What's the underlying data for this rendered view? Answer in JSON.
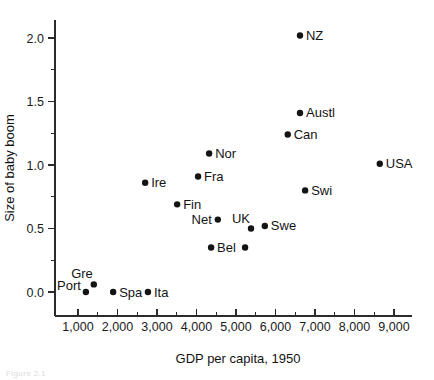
{
  "figure": {
    "caption_faint": "Figure 2.1"
  },
  "chart_data": {
    "type": "scatter",
    "title": "",
    "xlabel": "GDP per capita, 1950",
    "ylabel": "Size of baby boom",
    "xlim": [
      600,
      9600
    ],
    "ylim": [
      -0.28,
      2.22
    ],
    "grid": false,
    "legend": "none",
    "x_ticks": [
      1000,
      2000,
      3000,
      4000,
      5000,
      6000,
      7000,
      8000,
      9000
    ],
    "x_tick_labels": [
      "1,000",
      "2,000",
      "3,000",
      "4,000",
      "5,000",
      "6,000",
      "7,000",
      "8,000",
      "9,000"
    ],
    "x_minor_ticks": [
      1500,
      2500,
      3500,
      4500,
      5500,
      6500,
      7500,
      8500
    ],
    "y_ticks": [
      0.0,
      0.5,
      1.0,
      1.5,
      2.0
    ],
    "y_tick_labels": [
      "0.0",
      "0.5",
      "1.0",
      "1.5",
      "2.0"
    ],
    "y_minor_ticks": [
      0.25,
      0.75,
      1.25,
      1.75
    ],
    "points": [
      {
        "label": "NZ",
        "x": 6620,
        "y": 2.02,
        "label_pos": "right"
      },
      {
        "label": "Austl",
        "x": 6620,
        "y": 1.41,
        "label_pos": "right"
      },
      {
        "label": "Can",
        "x": 6310,
        "y": 1.24,
        "label_pos": "right"
      },
      {
        "label": "USA",
        "x": 8640,
        "y": 1.01,
        "label_pos": "right"
      },
      {
        "label": "Nor",
        "x": 4320,
        "y": 1.09,
        "label_pos": "right"
      },
      {
        "label": "Fra",
        "x": 4040,
        "y": 0.91,
        "label_pos": "right"
      },
      {
        "label": "Swi",
        "x": 6750,
        "y": 0.8,
        "label_pos": "right"
      },
      {
        "label": "Ire",
        "x": 2700,
        "y": 0.86,
        "label_pos": "right"
      },
      {
        "label": "Fin",
        "x": 3510,
        "y": 0.69,
        "label_pos": "right"
      },
      {
        "label": "Net",
        "x": 4540,
        "y": 0.57,
        "label_pos": "left"
      },
      {
        "label": "Swe",
        "x": 5730,
        "y": 0.52,
        "label_pos": "right"
      },
      {
        "label": "UK",
        "x": 5380,
        "y": 0.5,
        "label_pos": "above"
      },
      {
        "label": "",
        "x": 5230,
        "y": 0.35,
        "label_pos": "none"
      },
      {
        "label": "Bel",
        "x": 4370,
        "y": 0.35,
        "label_pos": "right"
      },
      {
        "label": "Gre",
        "x": 1400,
        "y": 0.06,
        "label_pos": "above"
      },
      {
        "label": "Port",
        "x": 1200,
        "y": 0.0,
        "label_pos": "upleft"
      },
      {
        "label": "Spa",
        "x": 1890,
        "y": 0.0,
        "label_pos": "right"
      },
      {
        "label": "Ita",
        "x": 2770,
        "y": 0.0,
        "label_pos": "right"
      }
    ]
  }
}
